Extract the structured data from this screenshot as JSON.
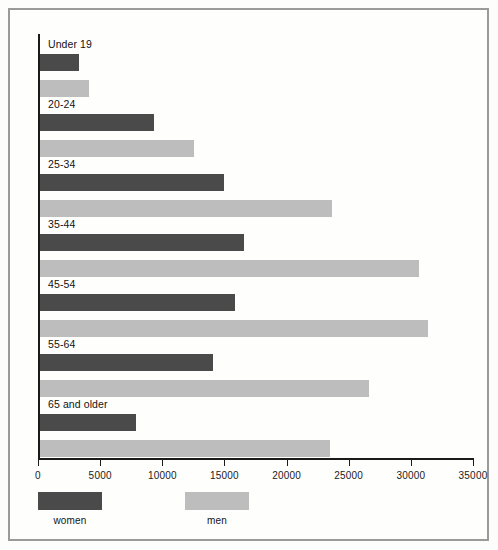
{
  "chart_data": {
    "type": "bar",
    "orientation": "horizontal",
    "title": "",
    "xlabel": "",
    "ylabel": "",
    "xlim": [
      0,
      35000
    ],
    "grid": false,
    "legend_position": "bottom-left",
    "categories": [
      "Under 19",
      "20-24",
      "25-34",
      "35-44",
      "45-54",
      "55-64",
      "65 and older"
    ],
    "tick_labels": [
      "0",
      "5000",
      "10000",
      "15000",
      "20000",
      "25000",
      "30000",
      "35000"
    ],
    "tick_values": [
      0,
      5000,
      10000,
      15000,
      20000,
      25000,
      30000,
      35000
    ],
    "series": [
      {
        "name": "women",
        "color": "#4a4a4a",
        "values": [
          3100,
          9200,
          14800,
          16400,
          15700,
          13900,
          7700
        ]
      },
      {
        "name": "men",
        "color": "#bdbdbd",
        "values": [
          3950,
          12400,
          23500,
          30500,
          31200,
          26500,
          23300
        ]
      }
    ]
  },
  "legend": {
    "items": [
      {
        "label": "women",
        "color": "#4a4a4a"
      },
      {
        "label": "men",
        "color": "#bdbdbd"
      }
    ]
  }
}
